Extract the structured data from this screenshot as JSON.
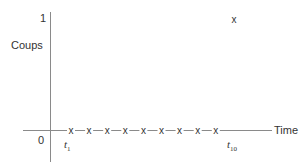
{
  "chart_data": {
    "type": "scatter",
    "title": "",
    "xlabel": "Time",
    "ylabel": "Coups",
    "x": [
      "t1",
      "t2",
      "t3",
      "t4",
      "t5",
      "t6",
      "t7",
      "t8",
      "t9",
      "t10"
    ],
    "values": [
      0,
      0,
      0,
      0,
      0,
      0,
      0,
      0,
      0,
      1
    ],
    "y_ticks": [
      "0",
      "1"
    ],
    "x_tick_labels": [
      {
        "label": "t",
        "sub": "1"
      },
      {
        "label": "t",
        "sub": "10"
      }
    ],
    "marker": "x",
    "ylim": [
      0,
      1
    ],
    "grid": false,
    "legend": null
  },
  "axis": {
    "y_top_label": "1",
    "y_zero_label": "0",
    "y_title": "Coups",
    "x_title": "Time",
    "x_first": {
      "t": "t",
      "sub": "1"
    },
    "x_last": {
      "t": "t",
      "sub": "10"
    }
  },
  "marker_glyph": "x",
  "colors": {
    "axis": "#8a8a8a",
    "marker": "#333333",
    "text": "#333333"
  }
}
